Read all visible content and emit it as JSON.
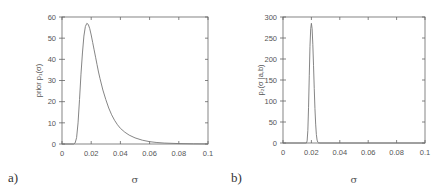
{
  "chart_data": [
    {
      "id": "a",
      "type": "line",
      "panel_label": "a)",
      "title": "",
      "xlabel": "σ",
      "ylabel": "prior p₁(σ)",
      "xlim": [
        0,
        0.1
      ],
      "ylim": [
        0,
        60
      ],
      "xticks": [
        0,
        0.02,
        0.04,
        0.06,
        0.08,
        0.1
      ],
      "xtick_labels": [
        "0",
        "0.02",
        "0.04",
        "0.06",
        "0.08",
        "0.1"
      ],
      "yticks": [
        0,
        10,
        20,
        30,
        40,
        50,
        60
      ],
      "ytick_labels": [
        "0",
        "10",
        "20",
        "30",
        "40",
        "50",
        "60"
      ],
      "grid": false,
      "series": [
        {
          "name": "prior",
          "x": [
            0,
            0.008,
            0.009,
            0.01,
            0.011,
            0.012,
            0.013,
            0.014,
            0.015,
            0.016,
            0.017,
            0.018,
            0.019,
            0.02,
            0.021,
            0.022,
            0.023,
            0.024,
            0.025,
            0.026,
            0.028,
            0.03,
            0.032,
            0.034,
            0.036,
            0.038,
            0.04,
            0.043,
            0.046,
            0.05,
            0.055,
            0.06,
            0.065,
            0.07,
            0.08,
            0.09,
            0.1
          ],
          "y": [
            0,
            0,
            0.5,
            3,
            10,
            21,
            33,
            43,
            51,
            55.5,
            57,
            56.5,
            54.5,
            51.5,
            48,
            44.5,
            41,
            37.5,
            34,
            31,
            25.5,
            21,
            17,
            13.8,
            11.2,
            9.1,
            7.4,
            5.6,
            4.2,
            2.9,
            1.8,
            1.1,
            0.7,
            0.45,
            0.2,
            0.08,
            0.03
          ]
        }
      ]
    },
    {
      "id": "b",
      "type": "line",
      "panel_label": "b)",
      "title": "",
      "xlabel": "σ",
      "ylabel": "p₂(σ |a,b)",
      "xlim": [
        0,
        0.1
      ],
      "ylim": [
        0,
        300
      ],
      "xticks": [
        0,
        0.02,
        0.04,
        0.06,
        0.08,
        0.1
      ],
      "xtick_labels": [
        "0",
        "0.02",
        "0.04",
        "0.06",
        "0.08",
        "0.1"
      ],
      "yticks": [
        0,
        50,
        100,
        150,
        200,
        250,
        300
      ],
      "ytick_labels": [
        "0",
        "50",
        "100",
        "150",
        "200",
        "250",
        "300"
      ],
      "grid": false,
      "series": [
        {
          "name": "posterior",
          "x": [
            0,
            0.0165,
            0.017,
            0.0175,
            0.018,
            0.0185,
            0.019,
            0.0195,
            0.02,
            0.0205,
            0.021,
            0.0215,
            0.022,
            0.0225,
            0.023,
            0.0235,
            0.024,
            0.0245,
            0.025,
            0.026,
            0.1
          ],
          "y": [
            0,
            0,
            5,
            30,
            85,
            160,
            230,
            272,
            285,
            272,
            235,
            185,
            130,
            82,
            45,
            20,
            7,
            2,
            0.5,
            0,
            0
          ]
        }
      ]
    }
  ]
}
